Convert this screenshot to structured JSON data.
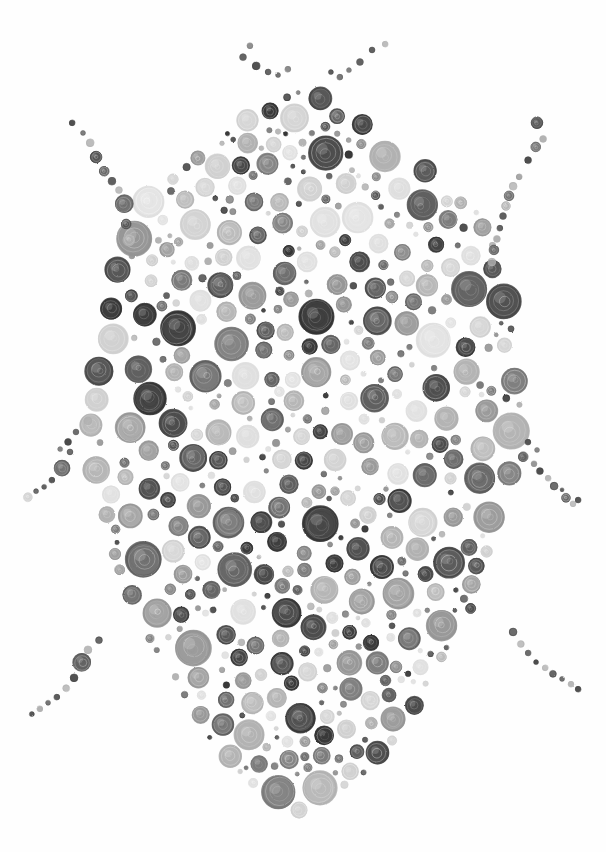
{
  "artwork": {
    "title": "Beetle",
    "subject": "beetle-bug",
    "medium": "colored-pencil-dot-stipple",
    "canvas": {
      "width": 606,
      "height": 852,
      "background": "#fefefe"
    },
    "technique": "hand-drawn concentric-ring pencil circles of varied size and gray value arranged to form a beetle silhouette",
    "palette": {
      "background": "#fefefe",
      "darkest": "#323232",
      "dark": "#474747",
      "dark_mid": "#5c5c5c",
      "mid": "#787878",
      "mid_light": "#949494",
      "light": "#b0b0b0",
      "lightest": "#cfcfcf",
      "pale": "#dedede"
    },
    "anatomy": {
      "body": {
        "name": "elytra-body",
        "shape": "egg-oval",
        "center_x": 303,
        "top_y": 92,
        "bottom_y": 812,
        "left_x": 84,
        "right_x": 522
      },
      "antennae": {
        "count": 2,
        "arrangement": "V-splay from head apex"
      },
      "legs": {
        "count": 6,
        "pairs": 3,
        "labels": [
          "fore-leg",
          "mid-leg",
          "hind-leg"
        ]
      }
    },
    "size_range": {
      "min_radius": 2,
      "max_radius": 19
    },
    "dot_count_approx": 540
  },
  "chart_data": {
    "type": "scatter",
    "xlabel": "",
    "ylabel": "",
    "xlim": [
      0,
      606
    ],
    "ylim": [
      0,
      852
    ],
    "grid": false,
    "legend": "none",
    "note": "Each point is a hand-drawn pencil circle. Fields: cx, cy, r (px), v (gray value hex).",
    "value_levels": [
      "#323232",
      "#474747",
      "#5c5c5c",
      "#787878",
      "#949494",
      "#b0b0b0",
      "#cfcfcf",
      "#dedede"
    ],
    "groups": [
      {
        "name": "antenna-left",
        "points": [
          [
            243,
            57,
            3.5,
            "#5c5c5c"
          ],
          [
            250,
            46,
            3,
            "#787878"
          ],
          [
            256,
            66,
            4,
            "#474747"
          ],
          [
            268,
            72,
            3,
            "#474747"
          ],
          [
            278,
            75,
            2.5,
            "#5c5c5c"
          ],
          [
            288,
            69,
            3,
            "#787878"
          ]
        ]
      },
      {
        "name": "antenna-right",
        "points": [
          [
            360,
            62,
            3.5,
            "#5c5c5c"
          ],
          [
            372,
            50,
            3,
            "#474747"
          ],
          [
            349,
            70,
            2.5,
            "#787878"
          ],
          [
            385,
            44,
            3,
            "#b0b0b0"
          ],
          [
            340,
            77,
            3,
            "#5c5c5c"
          ],
          [
            331,
            72,
            2.5,
            "#474747"
          ]
        ]
      },
      {
        "name": "leg-fore-left",
        "points": [
          [
            72,
            123,
            3,
            "#474747"
          ],
          [
            83,
            133,
            2.5,
            "#5c5c5c"
          ],
          [
            90,
            143,
            4,
            "#b0b0b0"
          ],
          [
            96,
            157,
            6,
            "#474747"
          ],
          [
            104,
            171,
            5,
            "#474747"
          ],
          [
            112,
            181,
            4,
            "#5c5c5c"
          ],
          [
            119,
            190,
            3.5,
            "#b0b0b0"
          ],
          [
            124,
            204,
            9,
            "#5c5c5c"
          ],
          [
            126,
            224,
            5,
            "#474747"
          ],
          [
            129,
            240,
            6,
            "#b0b0b0"
          ],
          [
            132,
            256,
            3,
            "#949494"
          ]
        ]
      },
      {
        "name": "leg-fore-right",
        "points": [
          [
            537,
            123,
            6,
            "#474747"
          ],
          [
            543,
            139,
            3.5,
            "#b0b0b0"
          ],
          [
            536,
            147,
            5,
            "#5c5c5c"
          ],
          [
            528,
            160,
            3.5,
            "#474747"
          ],
          [
            519,
            177,
            3,
            "#949494"
          ],
          [
            513,
            186,
            4,
            "#b0b0b0"
          ],
          [
            509,
            196,
            5,
            "#5c5c5c"
          ],
          [
            506,
            206,
            4.5,
            "#b0b0b0"
          ],
          [
            503,
            216,
            3.5,
            "#5c5c5c"
          ],
          [
            500,
            228,
            3,
            "#474747"
          ],
          [
            497,
            239,
            3.5,
            "#b0b0b0"
          ],
          [
            494,
            250,
            5,
            "#5c5c5c"
          ],
          [
            492,
            262,
            4,
            "#b0b0b0"
          ]
        ]
      },
      {
        "name": "leg-mid-left",
        "points": [
          [
            88,
            421,
            4,
            "#b0b0b0"
          ],
          [
            76,
            432,
            3,
            "#5c5c5c"
          ],
          [
            68,
            442,
            3.5,
            "#474747"
          ],
          [
            60,
            449,
            2.5,
            "#787878"
          ],
          [
            70,
            452,
            3,
            "#474747"
          ],
          [
            62,
            468,
            8,
            "#5c5c5c"
          ],
          [
            52,
            480,
            3,
            "#474747"
          ],
          [
            44,
            487,
            2.5,
            "#5c5c5c"
          ],
          [
            36,
            491,
            2.5,
            "#474747"
          ],
          [
            28,
            497,
            4.5,
            "#cfcfcf"
          ]
        ]
      },
      {
        "name": "leg-mid-right",
        "points": [
          [
            528,
            442,
            3,
            "#474747"
          ],
          [
            537,
            450,
            2.5,
            "#787878"
          ],
          [
            523,
            457,
            5,
            "#5c5c5c"
          ],
          [
            534,
            464,
            3,
            "#949494"
          ],
          [
            540,
            471,
            3.5,
            "#474747"
          ],
          [
            548,
            478,
            3,
            "#b0b0b0"
          ],
          [
            554,
            486,
            4,
            "#474747"
          ],
          [
            562,
            490,
            2,
            "#5c5c5c"
          ],
          [
            566,
            498,
            4.5,
            "#474747"
          ],
          [
            573,
            504,
            3,
            "#b0b0b0"
          ],
          [
            578,
            500,
            3,
            "#474747"
          ]
        ]
      },
      {
        "name": "leg-hind-left",
        "points": [
          [
            99,
            640,
            3.5,
            "#474747"
          ],
          [
            88,
            650,
            4,
            "#b0b0b0"
          ],
          [
            82,
            662,
            9,
            "#5c5c5c"
          ],
          [
            74,
            678,
            4,
            "#474747"
          ],
          [
            66,
            688,
            3.5,
            "#b0b0b0"
          ],
          [
            57,
            697,
            3,
            "#474747"
          ],
          [
            48,
            703,
            2.5,
            "#5c5c5c"
          ],
          [
            40,
            709,
            3,
            "#b0b0b0"
          ],
          [
            32,
            714,
            2.5,
            "#474747"
          ]
        ]
      },
      {
        "name": "leg-hind-right",
        "points": [
          [
            513,
            632,
            4,
            "#474747"
          ],
          [
            521,
            644,
            3.5,
            "#b0b0b0"
          ],
          [
            528,
            653,
            3,
            "#5c5c5c"
          ],
          [
            536,
            662,
            2.5,
            "#474747"
          ],
          [
            545,
            668,
            3,
            "#b0b0b0"
          ],
          [
            553,
            674,
            3.5,
            "#474747"
          ],
          [
            562,
            679,
            2.5,
            "#5c5c5c"
          ],
          [
            571,
            684,
            3,
            "#b0b0b0"
          ],
          [
            578,
            689,
            3,
            "#474747"
          ]
        ]
      },
      {
        "name": "body-field",
        "note": "dense interior of elytra; generated procedurally from a seeded poisson-like fill bounded by the egg silhouette",
        "point_count_approx": 470
      }
    ]
  },
  "caption": {
    "alt_text": "A beetle drawn entirely from hundreds of small hand-sketched circles in shades of gray, with antennae and six legs made of dot chains."
  }
}
